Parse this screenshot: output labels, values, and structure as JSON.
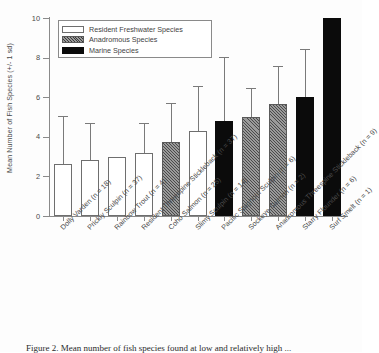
{
  "chart_data": {
    "type": "bar",
    "title": "",
    "xlabel": "",
    "ylabel": "Mean Number of Fish Species (+/- 1 sd)",
    "ylim": [
      0,
      10
    ],
    "yticks": [
      0,
      2,
      4,
      6,
      8,
      10
    ],
    "grid": false,
    "legend_position": "top-left",
    "categories": [
      "Dolly Varden (n = 18)",
      "Prickly Sculpin (n = 37)",
      "Rainbow Trout (n = 4)",
      "Resident Threespine Stickleback (n = 37)",
      "Coho Salmon (n = 25)",
      "Slimy Sculpin (n = 14)",
      "Pacific Staghorn Sculpin (n = 6)",
      "Sockeye Salmon (n = 2)",
      "Anadromous Threespine Stickleback (n = 9)",
      "Starry Flounder (n = 6)",
      "Surf Smelt (n = 1)"
    ],
    "values": [
      2.65,
      2.85,
      3.0,
      3.2,
      3.75,
      4.3,
      4.8,
      5.0,
      5.65,
      6.0,
      10.0
    ],
    "errors_upper": [
      5.0,
      4.65,
      3.0,
      4.65,
      5.65,
      6.5,
      8.0,
      6.4,
      7.55,
      8.4,
      null
    ],
    "groups": [
      "fresh",
      "fresh",
      "fresh",
      "fresh",
      "anad",
      "fresh",
      "marine",
      "anad",
      "anad",
      "marine",
      "marine"
    ],
    "series": [
      {
        "name": "Mean Number of Fish Species",
        "values": [
          2.65,
          2.85,
          3.0,
          3.2,
          3.75,
          4.3,
          4.8,
          5.0,
          5.65,
          6.0,
          10.0
        ]
      }
    ],
    "sample_sizes": [
      18,
      37,
      4,
      37,
      25,
      14,
      6,
      2,
      9,
      6,
      1
    ]
  },
  "legend": {
    "items": [
      {
        "label": "Resident Freshwater Species",
        "group": "fresh",
        "color": "#ffffff"
      },
      {
        "label": "Anadromous Species",
        "group": "anad",
        "color": "#9a9a9a"
      },
      {
        "label": "Marine Species",
        "group": "marine",
        "color": "#0b0b0b"
      }
    ]
  },
  "axis": {
    "y_title": "Mean Number of Fish Species (+/- 1 sd)",
    "y_tick_labels": [
      "10",
      "8",
      "6",
      "4",
      "2",
      "0"
    ]
  },
  "caption": {
    "text": "Figure 2. Mean number of fish species found at low and relatively high ..."
  },
  "colors": {
    "axis": "#8a8a8a",
    "error_bar": "#7a7a7a",
    "bar_outline": "#6e6e6e",
    "marine": "#0b0b0b",
    "anadromous": "#9a9a9a",
    "freshwater": "#ffffff"
  }
}
